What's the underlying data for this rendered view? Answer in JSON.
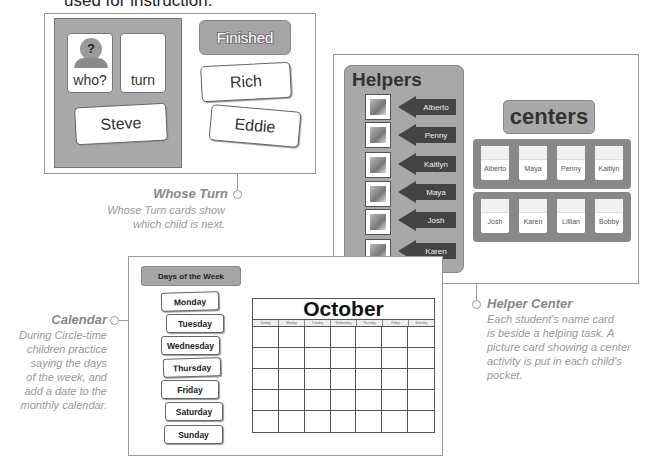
{
  "top_text": "used for instruction.",
  "whose_turn": {
    "board_cards": [
      {
        "label": "who?",
        "icon": "person-question-icon"
      },
      {
        "label": "turn",
        "icon": ""
      }
    ],
    "current_name": "Steve",
    "finished_label": "Finished",
    "finished_names": [
      "Rich",
      "Eddie"
    ],
    "caption_title": "Whose Turn",
    "caption_lines": [
      "Whose Turn cards show",
      "which child is next."
    ]
  },
  "helper_center": {
    "helpers_title": "Helpers",
    "helpers": [
      "Alberto",
      "Penny",
      "Kaitlyn",
      "Maya",
      "Josh",
      "Karen"
    ],
    "centers_title": "centers",
    "centers_rows": [
      [
        "Alberto",
        "Maya",
        "Penny",
        "Kaitlyn"
      ],
      [
        "Josh",
        "Karen",
        "Lillian",
        "Bobby"
      ]
    ],
    "caption_title": "Helper Center",
    "caption_lines": [
      "Each student's name card",
      "is beside a helping task. A",
      "picture card showing a center",
      "activity is put in each child's",
      "pocket."
    ]
  },
  "calendar": {
    "days_title": "Days of the Week",
    "days": [
      "Monday",
      "Tuesday",
      "Wednesday",
      "Thursday",
      "Friday",
      "Saturday",
      "Sunday"
    ],
    "month": "October",
    "weekday_headers": [
      "Sunday",
      "Monday",
      "Tuesday",
      "Wednesday",
      "Thursday",
      "Friday",
      "Saturday"
    ],
    "caption_title": "Calendar",
    "caption_lines": [
      "During Circle-time",
      "children practice",
      "saying the days",
      "of the week, and",
      "add a date to the",
      "monthly calendar."
    ]
  }
}
